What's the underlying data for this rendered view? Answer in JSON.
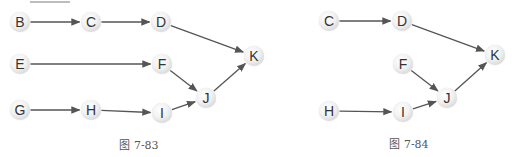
{
  "figures": [
    {
      "id": "fig1",
      "caption": "图 7-83",
      "caption_pos": {
        "x": 139,
        "y": 136
      },
      "nodes": [
        {
          "label": "B",
          "x": 20,
          "y": 22
        },
        {
          "label": "C",
          "x": 91,
          "y": 22
        },
        {
          "label": "D",
          "x": 161,
          "y": 22
        },
        {
          "label": "E",
          "x": 20,
          "y": 64
        },
        {
          "label": "F",
          "x": 162,
          "y": 64
        },
        {
          "label": "G",
          "x": 20,
          "y": 110
        },
        {
          "label": "H",
          "x": 91,
          "y": 110
        },
        {
          "label": "I",
          "x": 162,
          "y": 113
        },
        {
          "label": "J",
          "x": 206,
          "y": 98
        },
        {
          "label": "K",
          "x": 254,
          "y": 56
        }
      ],
      "edges": [
        [
          "B",
          "C"
        ],
        [
          "C",
          "D"
        ],
        [
          "D",
          "K"
        ],
        [
          "E",
          "F"
        ],
        [
          "F",
          "J"
        ],
        [
          "G",
          "H"
        ],
        [
          "H",
          "I"
        ],
        [
          "I",
          "J"
        ],
        [
          "J",
          "K"
        ]
      ]
    },
    {
      "id": "fig2",
      "caption": "图 7-84",
      "caption_pos": {
        "x": 409,
        "y": 135
      },
      "nodes": [
        {
          "label": "C",
          "x": 329,
          "y": 21
        },
        {
          "label": "D",
          "x": 402,
          "y": 21
        },
        {
          "label": "F",
          "x": 403,
          "y": 64
        },
        {
          "label": "H",
          "x": 329,
          "y": 111
        },
        {
          "label": "I",
          "x": 403,
          "y": 112
        },
        {
          "label": "J",
          "x": 447,
          "y": 98
        },
        {
          "label": "K",
          "x": 495,
          "y": 55
        }
      ],
      "edges": [
        [
          "C",
          "D"
        ],
        [
          "D",
          "K"
        ],
        [
          "F",
          "J"
        ],
        [
          "H",
          "I"
        ],
        [
          "I",
          "J"
        ],
        [
          "J",
          "K"
        ]
      ]
    }
  ],
  "colors": {
    "edge": "#555555",
    "node_text": "#333333",
    "caption": "#555555"
  }
}
